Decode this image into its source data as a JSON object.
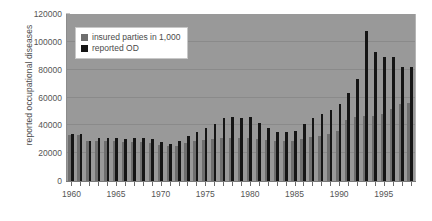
{
  "chart_data": {
    "type": "bar",
    "title": "",
    "xlabel": "",
    "ylabel": "reported occupational diseases",
    "ylim": [
      0,
      120000
    ],
    "ytick_values": [
      0,
      20000,
      40000,
      60000,
      80000,
      100000,
      120000
    ],
    "ytick_labels": [
      "0",
      "20000",
      "40000",
      "60000",
      "80000",
      "100000",
      "120000"
    ],
    "grid": true,
    "legend_position": "top-left",
    "xtick_labels": [
      "1960",
      "1965",
      "1970",
      "1975",
      "1980",
      "1985",
      "1990",
      "1995"
    ],
    "xtick_years": [
      1960,
      1965,
      1970,
      1975,
      1980,
      1985,
      1990,
      1995
    ],
    "categories": [
      1960,
      1961,
      1962,
      1963,
      1964,
      1965,
      1966,
      1967,
      1968,
      1969,
      1970,
      1971,
      1972,
      1973,
      1974,
      1975,
      1976,
      1977,
      1978,
      1979,
      1980,
      1981,
      1982,
      1983,
      1984,
      1985,
      1986,
      1987,
      1988,
      1989,
      1990,
      1991,
      1992,
      1993,
      1994,
      1995,
      1996,
      1997,
      1998
    ],
    "series": [
      {
        "name": "insured parties in 1,000",
        "color": "#6e6e6e",
        "values": [
          33000,
          33000,
          28500,
          28500,
          28500,
          28500,
          28000,
          28000,
          28000,
          27500,
          26000,
          25000,
          25500,
          27000,
          29000,
          29500,
          30000,
          31000,
          31000,
          31000,
          31000,
          30500,
          29500,
          28500,
          28500,
          29000,
          30500,
          31500,
          32500,
          34000,
          36000,
          44000,
          46000,
          47000,
          47000,
          48000,
          52000,
          55000,
          56000
        ]
      },
      {
        "name": "reported OD",
        "color": "#151515",
        "values": [
          34000,
          34000,
          29000,
          31000,
          31000,
          31000,
          30000,
          31000,
          31000,
          30000,
          28000,
          26500,
          28500,
          32000,
          35000,
          38000,
          41000,
          45000,
          46000,
          45000,
          46000,
          42000,
          38000,
          35500,
          35500,
          36000,
          41000,
          45000,
          48000,
          51000,
          55000,
          63000,
          73000,
          108000,
          93000,
          89000,
          89000,
          82000,
          82000
        ]
      }
    ]
  },
  "legend": {
    "items": [
      {
        "label": "insured parties in 1,000"
      },
      {
        "label": "reported OD"
      }
    ]
  },
  "colors": {
    "plot_background": "#999999",
    "gridline": "#8a8a8a",
    "insured": "#6e6e6e",
    "reported_od": "#151515",
    "text": "#555555"
  }
}
